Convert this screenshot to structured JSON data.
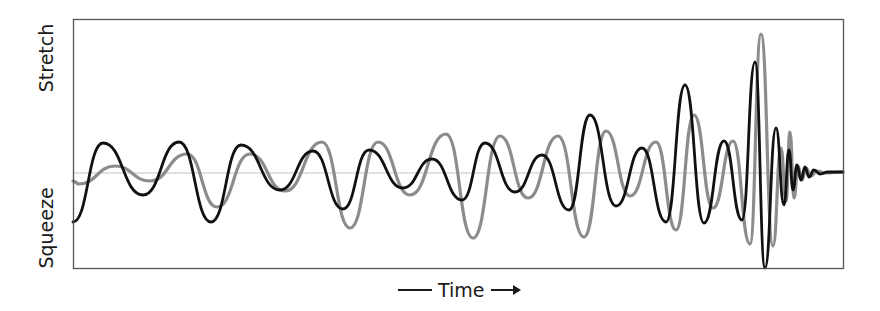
{
  "labels": {
    "y_top": "Stretch",
    "y_bottom": "Squeeze",
    "x": "Time"
  },
  "colors": {
    "frame": "#555555",
    "baseline": "#c4c4c4",
    "series_black": "#111111",
    "series_gray": "#8c8c8c"
  },
  "chart_data": {
    "type": "line",
    "title": "",
    "xlabel": "Time",
    "ylabel_top": "Stretch",
    "ylabel_bottom": "Squeeze",
    "grid": false,
    "legend": null,
    "axis_ticks": "none",
    "plot_box_px": {
      "left": 73,
      "top": 20,
      "right": 843,
      "bottom": 268
    },
    "baseline_y_px": 173,
    "ylim": [
      -1,
      1
    ],
    "note": "Coordinates are pixel positions of extrema along each waveform (x increases with time; lower y = stretch, higher y = squeeze).",
    "series": [
      {
        "name": "black",
        "color": "#111111",
        "points": [
          [
            73,
            222
          ],
          [
            103,
            143
          ],
          [
            143,
            195
          ],
          [
            179,
            142
          ],
          [
            211,
            222
          ],
          [
            241,
            145
          ],
          [
            280,
            190
          ],
          [
            313,
            151
          ],
          [
            343,
            209
          ],
          [
            369,
            150
          ],
          [
            403,
            188
          ],
          [
            432,
            159
          ],
          [
            462,
            200
          ],
          [
            485,
            143
          ],
          [
            515,
            192
          ],
          [
            542,
            155
          ],
          [
            569,
            210
          ],
          [
            590,
            115
          ],
          [
            616,
            206
          ],
          [
            642,
            148
          ],
          [
            666,
            222
          ],
          [
            685,
            85
          ],
          [
            704,
            223
          ],
          [
            724,
            141
          ],
          [
            742,
            220
          ],
          [
            755,
            62
          ],
          [
            765,
            268
          ],
          [
            776,
            128
          ],
          [
            784,
            205
          ],
          [
            789,
            150
          ],
          [
            793,
            190
          ],
          [
            797,
            165
          ],
          [
            801,
            180
          ],
          [
            805,
            167
          ],
          [
            809,
            177
          ],
          [
            814,
            170
          ],
          [
            820,
            174
          ],
          [
            828,
            172
          ],
          [
            843,
            172
          ]
        ]
      },
      {
        "name": "gray",
        "color": "#8c8c8c",
        "points": [
          [
            73,
            181
          ],
          [
            79,
            184
          ],
          [
            115,
            166
          ],
          [
            150,
            181
          ],
          [
            187,
            154
          ],
          [
            217,
            207
          ],
          [
            250,
            154
          ],
          [
            285,
            191
          ],
          [
            322,
            142
          ],
          [
            350,
            228
          ],
          [
            378,
            142
          ],
          [
            410,
            195
          ],
          [
            446,
            134
          ],
          [
            473,
            238
          ],
          [
            500,
            136
          ],
          [
            528,
            198
          ],
          [
            558,
            136
          ],
          [
            584,
            237
          ],
          [
            606,
            131
          ],
          [
            630,
            196
          ],
          [
            656,
            142
          ],
          [
            676,
            230
          ],
          [
            694,
            115
          ],
          [
            713,
            208
          ],
          [
            733,
            141
          ],
          [
            750,
            244
          ],
          [
            761,
            34
          ],
          [
            773,
            246
          ],
          [
            781,
            148
          ],
          [
            786,
            201
          ],
          [
            790,
            132
          ],
          [
            794,
            198
          ],
          [
            798,
            166
          ],
          [
            802,
            180
          ],
          [
            806,
            168
          ],
          [
            811,
            176
          ],
          [
            817,
            171
          ],
          [
            825,
            173
          ],
          [
            843,
            172
          ]
        ]
      }
    ]
  }
}
